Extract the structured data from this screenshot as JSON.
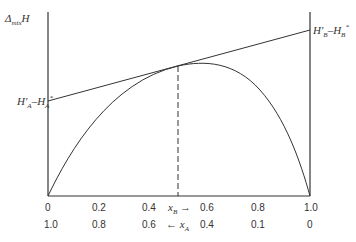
{
  "diagram": {
    "y_axis_label": {
      "symbol": "Δ",
      "subscript": "mix",
      "var": "H"
    },
    "left_intercept_label": {
      "a": "H′",
      "a_sub": "A",
      "sep": "–",
      "b": "H",
      "b_sub": "A",
      "b_sup": "*"
    },
    "right_intercept_label": {
      "a": "H′",
      "a_sub": "B",
      "sep": "–",
      "b": "H",
      "b_sub": "B",
      "b_sup": "*"
    },
    "x_axis_top_ticks": [
      "0",
      "0.2",
      "0.4",
      "0.6",
      "0.8",
      "1.0"
    ],
    "x_axis_bottom_ticks": [
      "1.0",
      "0.8",
      "0.6",
      "0.4",
      "0.1",
      "0"
    ],
    "xB_label": {
      "var": "x",
      "sub": "B",
      "arrow": "→"
    },
    "xA_label": {
      "var": "x",
      "sub": "A",
      "arrow": "←"
    },
    "curve": "concave mixing enthalpy curve from (0,0) to (1,0), maximum near x_B≈0.55",
    "tangent": "straight line tangent at x_B≈0.5, intercepts H′A–H*A at x_B=0 and H′B–H*B at x_B=1",
    "dashed_line": "vertical dashed line from tangent point down to x_B≈0.5",
    "stroke_color": "#333333"
  }
}
